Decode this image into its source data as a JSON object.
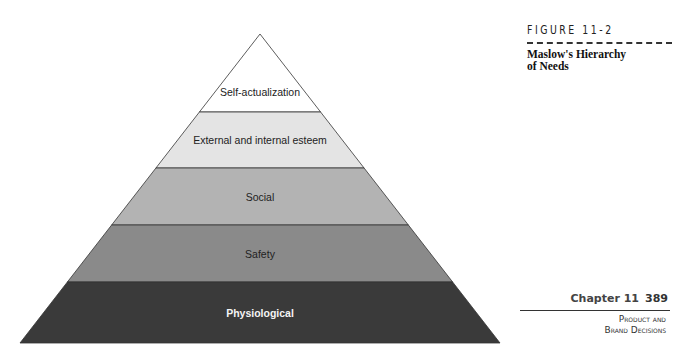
{
  "figure": {
    "number": "FIGURE 11-2",
    "title_line1": "Maslow's Hierarchy",
    "title_line2": "of Needs"
  },
  "pyramid": {
    "levels": [
      {
        "label": "Self-actualization",
        "color": "#ffffff",
        "text_color": "#222222"
      },
      {
        "label": "External and internal esteem",
        "color": "#e4e4e4",
        "text_color": "#222222"
      },
      {
        "label": "Social",
        "color": "#b3b3b3",
        "text_color": "#222222"
      },
      {
        "label": "Safety",
        "color": "#8a8a8a",
        "text_color": "#222222"
      },
      {
        "label": "Physiological",
        "color": "#3a3a3a",
        "text_color": "#f4f4f4"
      }
    ]
  },
  "footer": {
    "chapter": "Chapter 11",
    "page": "389",
    "section_line1": "Product and",
    "section_line2": "Brand Decisions"
  }
}
